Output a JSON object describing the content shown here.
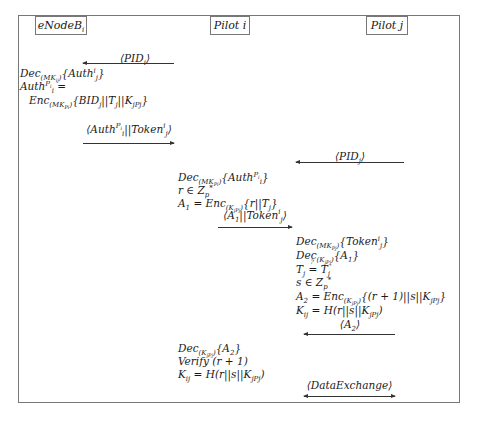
{
  "entities": {
    "enodeb": "eNodeB_i",
    "pilot_i": "Pilot i",
    "pilot_j": "Pilot j"
  },
  "messages": [
    {
      "label": "⟨PID_i⟩",
      "from": "Pilot i",
      "to": "eNodeB_i",
      "direction": "left"
    },
    {
      "label": "⟨Auth_i^{P_i} || Token_j^i⟩",
      "from": "eNodeB_i",
      "to": "Pilot i",
      "direction": "right"
    },
    {
      "label": "⟨PID_j⟩",
      "from": "Pilot j",
      "to": "Pilot i",
      "direction": "left"
    },
    {
      "label": "⟨A_1 || Token_j^i⟩",
      "from": "Pilot i",
      "to": "Pilot j",
      "direction": "right"
    },
    {
      "label": "⟨A_2⟩",
      "from": "Pilot j",
      "to": "Pilot i",
      "direction": "left"
    },
    {
      "label": "⟨DataExchange⟩",
      "from": "Pilot i",
      "to": "Pilot j",
      "direction": "both"
    }
  ],
  "steps": {
    "enodeb": [
      "Dec_(MK_ij){Auth_j^i}",
      "Auth_i^{P_i} =",
      "Enc_(MK_Pi){BID_j || T_j || K_jPj}"
    ],
    "pilot_i_1": [
      "Dec_(MK_Pi){Auth_i^{P_i}}",
      "r ∈ Z_p*",
      "A_1 = Enc_(K_jPj){r || T_j}"
    ],
    "pilot_j": [
      "Dec_(MK_Pj){Token_j^i}",
      "Dec_(K_jPj){A_1}",
      "T_j ≟ T_j'",
      "s ∈ Z_p*",
      "A_2 = Enc_(K_jPj){(r+1) || s || K_jPj}",
      "K_ij = H(r || s || K_jPj)"
    ],
    "pilot_i_2": [
      "Dec_(K_jPj){A_2}",
      "Verify (r+1)",
      "K_ij = H(r || s || K_jPj)"
    ]
  }
}
